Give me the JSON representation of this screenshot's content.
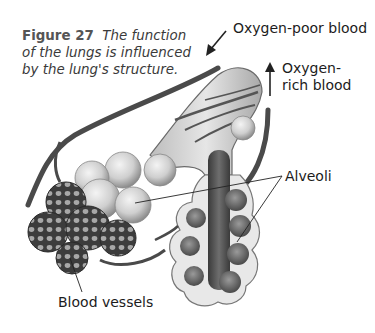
{
  "figure": {
    "number": "Figure 27",
    "caption": "The function of the lungs is influenced by the lung's structure."
  },
  "labels": {
    "oxygen_poor": "Oxygen-poor blood",
    "oxygen_rich": "Oxygen-rich blood",
    "alveoli": "Alveoli",
    "blood_vessels": "Blood vessels"
  },
  "arrows": {
    "oxygen_poor_direction": "down-left (into lung)",
    "oxygen_rich_direction": "up (out of lung)"
  },
  "colors": {
    "background": "#ffffff",
    "text": "#1c1c1c",
    "vessel": "#4a4a4a",
    "alveolus_light": "#d9d9d9",
    "capillary_net": "#3c3c3c"
  }
}
